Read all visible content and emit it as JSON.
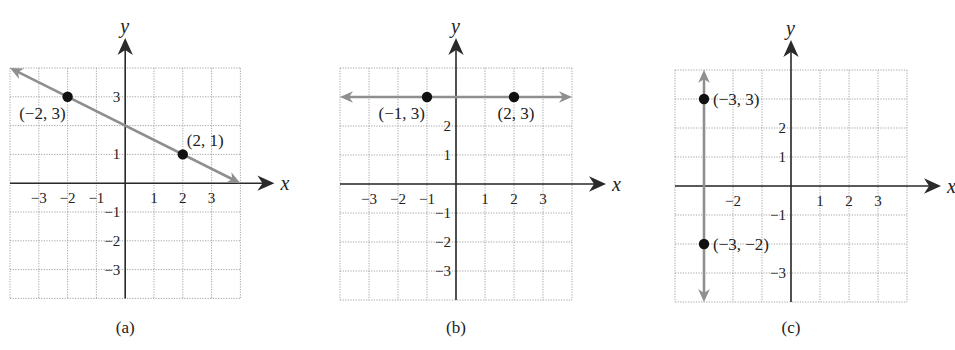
{
  "chart_data": [
    {
      "type": "line",
      "panel_label": "(a)",
      "xlabel": "x",
      "ylabel": "y",
      "xlim": [
        -4,
        4
      ],
      "ylim": [
        -4,
        4
      ],
      "grid": true,
      "x_ticks": [
        "-3",
        "-2",
        "-1",
        "1",
        "2",
        "3"
      ],
      "x_tick_values": [
        -3,
        -2,
        -1,
        1,
        2,
        3
      ],
      "y_ticks": [
        "3",
        "1",
        "-1",
        "-2",
        "-3"
      ],
      "y_tick_values": [
        3,
        1,
        -1,
        -2,
        -3
      ],
      "line": {
        "from": [
          -4,
          4
        ],
        "to": [
          4,
          0
        ],
        "equation": "y = -x/2 + 2",
        "arrows": "both"
      },
      "points": [
        {
          "x": -2,
          "y": 3,
          "label": "(−2, 3)",
          "label_pos": "below-left"
        },
        {
          "x": 2,
          "y": 1,
          "label": "(2, 1)",
          "label_pos": "above-right"
        }
      ]
    },
    {
      "type": "line",
      "panel_label": "(b)",
      "xlabel": "x",
      "ylabel": "y",
      "xlim": [
        -4,
        4
      ],
      "ylim": [
        -4,
        4
      ],
      "grid": true,
      "x_ticks": [
        "-3",
        "-2",
        "-1",
        "1",
        "2",
        "3"
      ],
      "x_tick_values": [
        -3,
        -2,
        -1,
        1,
        2,
        3
      ],
      "y_ticks": [
        "2",
        "1",
        "-1",
        "-2",
        "-3"
      ],
      "y_tick_values": [
        2,
        1,
        -1,
        -2,
        -3
      ],
      "line": {
        "from": [
          -4,
          3
        ],
        "to": [
          4,
          3
        ],
        "equation": "y = 3",
        "arrows": "both"
      },
      "points": [
        {
          "x": -1,
          "y": 3,
          "label": "(−1, 3)",
          "label_pos": "below-left"
        },
        {
          "x": 2,
          "y": 3,
          "label": "(2, 3)",
          "label_pos": "below"
        }
      ]
    },
    {
      "type": "line",
      "panel_label": "(c)",
      "xlabel": "x",
      "ylabel": "y",
      "xlim": [
        -4,
        4
      ],
      "ylim": [
        -4,
        4
      ],
      "grid": true,
      "x_ticks": [
        "-2",
        "1",
        "2",
        "3"
      ],
      "x_tick_values": [
        -2,
        1,
        2,
        3
      ],
      "y_ticks": [
        "2",
        "1",
        "-1",
        "-3"
      ],
      "y_tick_values": [
        2,
        1,
        -1,
        -3
      ],
      "line": {
        "from": [
          -3,
          4
        ],
        "to": [
          -3,
          -4
        ],
        "equation": "x = -3",
        "arrows": "both"
      },
      "points": [
        {
          "x": -3,
          "y": 3,
          "label": "(−3, 3)",
          "label_pos": "right"
        },
        {
          "x": -3,
          "y": -2,
          "label": "(−3, −2)",
          "label_pos": "right"
        }
      ]
    }
  ],
  "panels": [
    {
      "left": 10,
      "top": 68,
      "unit": 28.8
    },
    {
      "left": 340,
      "top": 68,
      "unit": 29.0
    },
    {
      "left": 675,
      "top": 70,
      "unit": 29.0
    }
  ],
  "colors": {
    "axis": "#2a2a2a",
    "grid": "#9a9a9a",
    "line": "#8f8f8f",
    "point": "#111111",
    "text": "#222222"
  }
}
